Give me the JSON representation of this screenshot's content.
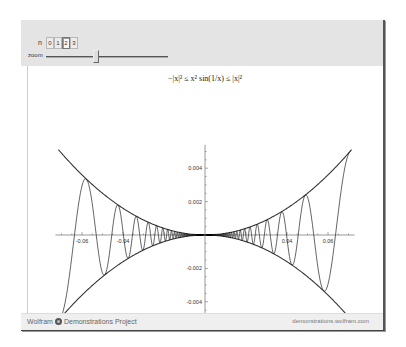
{
  "controls": {
    "setter": {
      "label": "n",
      "options": [
        "0",
        "1",
        "2",
        "3"
      ],
      "selected": "2"
    },
    "slider": {
      "label": "zoom",
      "value_fraction": 0.41
    }
  },
  "plot": {
    "equation": "−|x|² ≤ x² sin(1/x) ≤ |x|²",
    "x_tick_labels": [
      "-0.06",
      "-0.04",
      "0.04",
      "0.06"
    ],
    "y_tick_labels": [
      "0.004",
      "0.002",
      "-0.002",
      "-0.004"
    ],
    "colors": {
      "curve": "#222222",
      "bound": "#333333",
      "axis": "#555555"
    }
  },
  "chart_data": {
    "type": "line",
    "title": "−|x|² ≤ x² sin(1/x) ≤ |x|²",
    "xlabel": "",
    "ylabel": "",
    "xlim": [
      -0.0715,
      0.0715
    ],
    "ylim": [
      -0.0055,
      0.0055
    ],
    "x_ticks": [
      -0.06,
      -0.04,
      0.04,
      0.06
    ],
    "y_ticks": [
      0.004,
      0.002,
      -0.002,
      -0.004
    ],
    "grid": false,
    "series": [
      {
        "name": "x^2 sin(1/x)",
        "function": "x^2*sin(1/x)"
      },
      {
        "name": "|x|^2",
        "function": "x^2"
      },
      {
        "name": "-|x|^2",
        "function": "-x^2"
      }
    ]
  },
  "footer": {
    "brand_left": "Wolfram",
    "brand_right": "Demonstrations Project",
    "url": "demonstrations.wolfram.com"
  }
}
